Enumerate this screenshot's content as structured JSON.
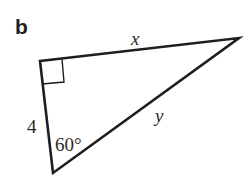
{
  "figure": {
    "part_label": "b",
    "shape": "right-triangle",
    "vertices": {
      "right_angle": [
        40,
        61
      ],
      "right": [
        239,
        38
      ],
      "bottom": [
        53,
        173
      ]
    },
    "stroke_color": "#1e1e1e",
    "labels": {
      "top_side": "x",
      "hypotenuse": "y",
      "left_side": "4",
      "angle": "60°"
    },
    "right_angle_marker": true
  }
}
